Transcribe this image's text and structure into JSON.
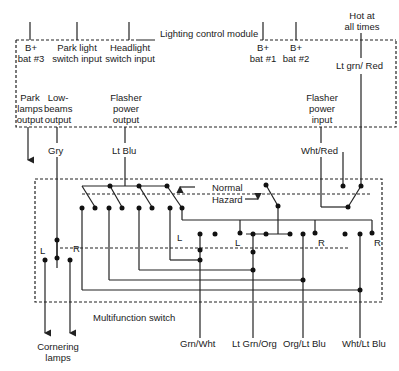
{
  "module": {
    "title": "Lighting control module",
    "inputs": [
      {
        "id": "b_bat3",
        "label_line1": "B+",
        "label_line2": "bat #3"
      },
      {
        "id": "park_light",
        "label_line1": "Park light",
        "label_line2": "switch input"
      },
      {
        "id": "headlight",
        "label_line1": "Headlight",
        "label_line2": "switch input"
      },
      {
        "id": "b_bat1",
        "label_line1": "B+",
        "label_line2": "bat #1"
      },
      {
        "id": "b_bat2",
        "label_line1": "B+",
        "label_line2": "bat #2"
      }
    ],
    "outputs": [
      {
        "id": "park_lamps",
        "label_line1": "Park",
        "label_line2": "lamps",
        "label_line3": "output"
      },
      {
        "id": "low_beams",
        "label_line1": "Low-",
        "label_line2": "beams",
        "label_line3": "output"
      },
      {
        "id": "flasher_out",
        "label_line1": "Flasher",
        "label_line2": "power",
        "label_line3": "output"
      },
      {
        "id": "flasher_in",
        "label_line1": "Flasher",
        "label_line2": "power",
        "label_line3": "input"
      }
    ]
  },
  "hot_at_all_times": {
    "line1": "Hot at",
    "line2": "all times"
  },
  "wires": {
    "lt_grn_red": "Lt grn/ Red",
    "gry": "Gry",
    "lt_blu": "Lt Blu",
    "wht_red": "Wht/Red"
  },
  "switch": {
    "title": "Multifunction switch",
    "normal_label": "Normal",
    "hazard_label": "Hazard",
    "contact_labels": [
      "L",
      "R",
      "L",
      "L",
      "R",
      "R"
    ]
  },
  "bottom_wires": [
    "Grn/Wht",
    "Lt Grn/Org",
    "Org/Lt Blu",
    "Wht/Lt Blu"
  ],
  "cornering": {
    "line1": "Cornering",
    "line2": "lamps"
  }
}
